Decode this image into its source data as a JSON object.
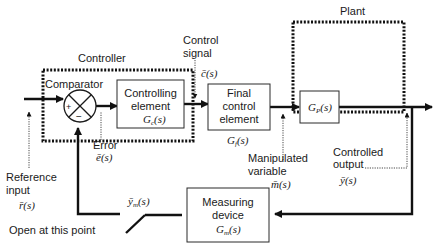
{
  "diagram": {
    "type": "feedback-control-block-diagram",
    "groups": {
      "controller": "Controller",
      "plant": "Plant"
    },
    "blocks": {
      "comparator": {
        "label": "Comparator",
        "plus": "+",
        "minus": "−"
      },
      "controlling_element": {
        "line1": "Controlling",
        "line2": "element",
        "tf": "G_c(s)",
        "tf_main": "G",
        "tf_sub": "c",
        "tf_arg": "(s)"
      },
      "final_control_element": {
        "line1": "Final",
        "line2": "control",
        "line3": "element",
        "tf_main": "G",
        "tf_sub": "f",
        "tf_arg": "(s)"
      },
      "process": {
        "tf_main": "G",
        "tf_sub": "P",
        "tf_arg": "(s)"
      },
      "measuring_device": {
        "line1": "Measuring",
        "line2": "device",
        "tf_main": "G",
        "tf_sub": "m",
        "tf_arg": "(s)"
      }
    },
    "signals": {
      "reference": {
        "line1": "Reference",
        "line2": "input",
        "symbol": "r̄(s)"
      },
      "error": {
        "label": "Error",
        "symbol": "ē(s)"
      },
      "control": {
        "line1": "Control",
        "line2": "signal",
        "symbol": "c̄(s)"
      },
      "manipulated": {
        "line1": "Manipulated",
        "line2": "variable",
        "symbol": "m̄(s)"
      },
      "output": {
        "line1": "Controlled",
        "line2": "output",
        "symbol": "ȳ(s)"
      },
      "measured": {
        "symbol_main": "ȳ",
        "symbol_sub": "m",
        "symbol_arg": "(s)"
      }
    },
    "annotations": {
      "open_point": "Open at this point"
    }
  }
}
